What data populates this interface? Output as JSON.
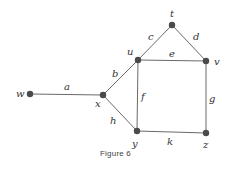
{
  "figure": {
    "caption": "Figure 6",
    "type": "undirected-graph"
  },
  "graph": {
    "vertices": [
      {
        "id": "w",
        "label": "w",
        "x": 30,
        "y": 94
      },
      {
        "id": "x",
        "label": "x",
        "x": 103,
        "y": 95
      },
      {
        "id": "u",
        "label": "u",
        "x": 138,
        "y": 60
      },
      {
        "id": "t",
        "label": "t",
        "x": 172,
        "y": 25
      },
      {
        "id": "v",
        "label": "v",
        "x": 206,
        "y": 61
      },
      {
        "id": "y",
        "label": "y",
        "x": 137,
        "y": 131
      },
      {
        "id": "z",
        "label": "z",
        "x": 206,
        "y": 133
      }
    ],
    "edges": [
      {
        "id": "a",
        "label": "a",
        "from": "w",
        "to": "x"
      },
      {
        "id": "b",
        "label": "b",
        "from": "x",
        "to": "u"
      },
      {
        "id": "c",
        "label": "c",
        "from": "u",
        "to": "t"
      },
      {
        "id": "d",
        "label": "d",
        "from": "t",
        "to": "v"
      },
      {
        "id": "e",
        "label": "e",
        "from": "u",
        "to": "v"
      },
      {
        "id": "f",
        "label": "f",
        "from": "u",
        "to": "y"
      },
      {
        "id": "g",
        "label": "g",
        "from": "v",
        "to": "z"
      },
      {
        "id": "h",
        "label": "h",
        "from": "x",
        "to": "y"
      },
      {
        "id": "k",
        "label": "k",
        "from": "y",
        "to": "z"
      }
    ]
  },
  "colors": {
    "node": "#4a4a4a",
    "edge": "#6a6a6a",
    "text": "#333333"
  }
}
